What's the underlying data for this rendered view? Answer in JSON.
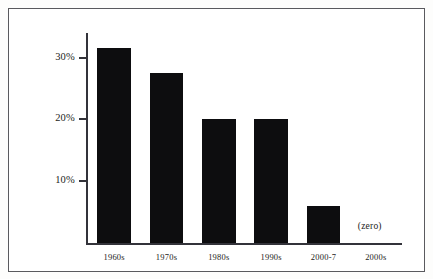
{
  "figure": {
    "frame_color": "#5a5a5e",
    "background_color": "#ffffff",
    "axis_color": "#33333a",
    "bar_color": "#0d0d0f"
  },
  "annotations": {
    "zero_note": "(zero)"
  },
  "chart_data": {
    "type": "bar",
    "title": "",
    "subtitle": "",
    "xlabel": "",
    "ylabel": "",
    "categories": [
      "1960s",
      "1970s",
      "1980s",
      "1990s",
      "2000-7",
      "2000s"
    ],
    "values": [
      31.5,
      27.5,
      20,
      20,
      6,
      0
    ],
    "value_labels": [
      "",
      "",
      "",
      "",
      "",
      "(zero)"
    ],
    "ytick_labels": [
      "10%",
      "20%",
      "30%"
    ],
    "ytick_values": [
      10,
      20,
      30
    ],
    "ylim": [
      0,
      34
    ],
    "grid": false,
    "legend": null,
    "bar_color": "#0d0d0f"
  }
}
